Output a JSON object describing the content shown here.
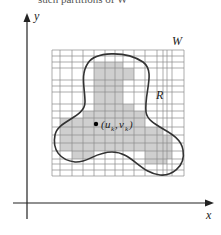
{
  "header": {
    "cutoff_caption": "such partitions of W"
  },
  "diagram": {
    "type": "region-partition-grid",
    "axes": {
      "x_label": "x",
      "y_label": "y"
    },
    "labels": {
      "window": "W",
      "region": "R",
      "point": "(uₖ, vₖ)",
      "point_u": "u",
      "point_u_sub": "k",
      "point_v": "v",
      "point_v_sub": "k"
    },
    "grid": {
      "x_lines": [
        52,
        60,
        72,
        83,
        94,
        105,
        115,
        123,
        134,
        145,
        157,
        163,
        167,
        172,
        184
      ],
      "y_lines": [
        50,
        56,
        62,
        68,
        80,
        86,
        92,
        104,
        111,
        118,
        127,
        135,
        143,
        151,
        159,
        164,
        170,
        176
      ]
    },
    "colors": {
      "grid_line": "#8a8a8a",
      "shade": "#cfcfcf",
      "curve": "#333333",
      "axis": "#222222",
      "point": "#000000"
    }
  }
}
